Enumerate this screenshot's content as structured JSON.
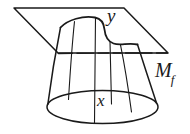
{
  "figure": {
    "background_color": "#ffffff",
    "stroke_color": "#1a1a1a",
    "labels": {
      "top_point": "y",
      "bottom_point": "x",
      "object_main": "M",
      "object_subscript": "f"
    },
    "parts": {
      "plane_name": "horizontal plane parallelogram",
      "cone_name": "truncated cone body",
      "base_name": "base ellipse",
      "wave_name": "wavy top rim curve",
      "hidden_line_name": "hidden plane intersection line"
    }
  }
}
